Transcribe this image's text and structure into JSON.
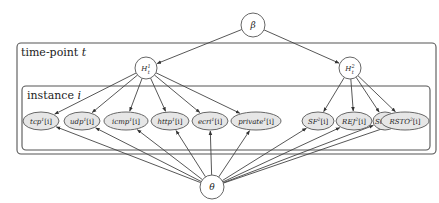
{
  "diagram": {
    "type": "plate-notation-bayesian-network",
    "top_node": {
      "id": "beta",
      "label": "β",
      "cx": 253,
      "cy": 25,
      "r": 12
    },
    "bottom_node": {
      "id": "theta",
      "label": "θ",
      "cx": 212,
      "cy": 187,
      "r": 12
    },
    "outer_plate": {
      "label": "time-point",
      "index_var": "t",
      "x": 17,
      "y": 43,
      "w": 419,
      "h": 111
    },
    "inner_plate": {
      "label": "instance",
      "index_var": "i",
      "x": 22,
      "y": 86,
      "w": 408,
      "h": 64
    },
    "hidden_nodes": [
      {
        "id": "H1",
        "base": "H",
        "sup": "1",
        "sub": "t",
        "cx": 146,
        "cy": 68,
        "r": 11
      },
      {
        "id": "H2",
        "base": "H",
        "sup": "2",
        "sub": "t",
        "cx": 350,
        "cy": 68,
        "r": 11
      }
    ],
    "observed_nodes": [
      {
        "id": "tcp",
        "base": "tcp",
        "sup": "1",
        "idx": "[i]",
        "cx": 45,
        "cy": 121,
        "rx": 19,
        "ry": 9,
        "parent": "H1"
      },
      {
        "id": "udp",
        "base": "udp",
        "sup": "1",
        "idx": "[i]",
        "cx": 86,
        "cy": 121,
        "rx": 19,
        "ry": 9,
        "parent": "H1"
      },
      {
        "id": "icmp",
        "base": "icmp",
        "sup": "1",
        "idx": "[i]",
        "cx": 131,
        "cy": 121,
        "rx": 22,
        "ry": 9,
        "parent": "H1"
      },
      {
        "id": "http",
        "base": "http",
        "sup": "1",
        "idx": "[i]",
        "cx": 175,
        "cy": 121,
        "rx": 20,
        "ry": 9,
        "parent": "H1"
      },
      {
        "id": "ecri",
        "base": "ecri",
        "sup": "1",
        "idx": "[i]",
        "cx": 217,
        "cy": 121,
        "rx": 19,
        "ry": 9,
        "parent": "H1"
      },
      {
        "id": "private",
        "base": "private",
        "sup": "1",
        "idx": "[i]",
        "cx": 265,
        "cy": 121,
        "rx": 25,
        "ry": 9,
        "parent": "H1"
      },
      {
        "id": "SF",
        "base": "SF",
        "sup": "2",
        "idx": "[i]",
        "cx": 316,
        "cy": 121,
        "rx": 17,
        "ry": 9,
        "parent": "H2"
      },
      {
        "id": "REJ",
        "base": "REJ",
        "sup": "2",
        "idx": "[i]",
        "cx": 355,
        "cy": 121,
        "rx": 20,
        "ry": 9,
        "parent": "H2"
      },
      {
        "id": "S0",
        "base": "S0",
        "sup": "2",
        "idx": "[i]",
        "cx": 390,
        "cy": 121,
        "rx": 14,
        "ry": 9,
        "parent": "H2"
      },
      {
        "id": "RSTO",
        "base": "RSTO",
        "sup": "2",
        "idx": "[i]",
        "cx": 411,
        "cy": 121,
        "rx": 0,
        "ry": 0,
        "parent": "H2"
      }
    ],
    "edges_note": "β → H¹ₜ, β → H²ₜ; H¹ₜ → {tcp, udp, icmp, http, ecri, private}; H²ₜ → {SF, REJ, S0, RSTO}; θ → every observed node",
    "colors": {
      "observed_fill": "#e6e6e6",
      "stroke": "#666666",
      "edge": "#444444",
      "background": "#ffffff"
    }
  }
}
